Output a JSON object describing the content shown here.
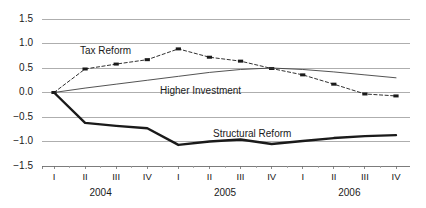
{
  "chart_data": {
    "type": "line",
    "title": "",
    "subtitle": "",
    "xlabel": "",
    "ylabel": "",
    "grid": true,
    "legend_position": "inline-annotations",
    "ylim": [
      -1.5,
      1.5
    ],
    "yticks": [
      "1.5",
      "1.0",
      "0.5",
      "0.0",
      "-0.5",
      "-1.0",
      "-1.5"
    ],
    "ytick_values": [
      1.5,
      1.0,
      0.5,
      0.0,
      -0.5,
      -1.0,
      -1.5
    ],
    "xtick_labels": [
      "I",
      "II",
      "III",
      "IV",
      "I",
      "II",
      "III",
      "IV",
      "I",
      "II",
      "III",
      "IV"
    ],
    "year_groups": [
      {
        "label": "2004",
        "start_index": 0,
        "end_index": 3
      },
      {
        "label": "2005",
        "start_index": 4,
        "end_index": 7
      },
      {
        "label": "2006",
        "start_index": 8,
        "end_index": 11
      }
    ],
    "x": [
      "2004 I",
      "2004 II",
      "2004 III",
      "2004 IV",
      "2005 I",
      "2005 II",
      "2005 III",
      "2005 IV",
      "2006 I",
      "2006 II",
      "2006 III",
      "2006 IV"
    ],
    "series": [
      {
        "name": "Tax Reform",
        "style": "dashed-with-square-markers",
        "color": "#1a1a1a",
        "markers": true,
        "values": [
          0.0,
          0.48,
          0.58,
          0.67,
          0.89,
          0.72,
          0.64,
          0.49,
          0.36,
          0.17,
          -0.03,
          -0.07
        ]
      },
      {
        "name": "Higher Investment",
        "style": "thin-solid",
        "color": "#404040",
        "markers": false,
        "values": [
          0.0,
          0.09,
          0.17,
          0.25,
          0.33,
          0.41,
          0.47,
          0.5,
          0.47,
          0.42,
          0.36,
          0.3
        ]
      },
      {
        "name": "Structural Reform",
        "style": "thick-solid",
        "color": "#1a1a1a",
        "markers": false,
        "values": [
          0.0,
          -0.62,
          -0.68,
          -0.73,
          -1.07,
          -1.0,
          -0.96,
          -1.05,
          -0.99,
          -0.93,
          -0.89,
          -0.87
        ]
      }
    ],
    "annotations": [
      {
        "text": "Tax Reform",
        "series": "Tax Reform",
        "x": 80,
        "y": 45
      },
      {
        "text": "Higher Investment",
        "series": "Higher Investment",
        "x": 160,
        "y": 85
      },
      {
        "text": "Structural Reform",
        "series": "Structural Reform",
        "x": 213,
        "y": 128
      }
    ]
  }
}
